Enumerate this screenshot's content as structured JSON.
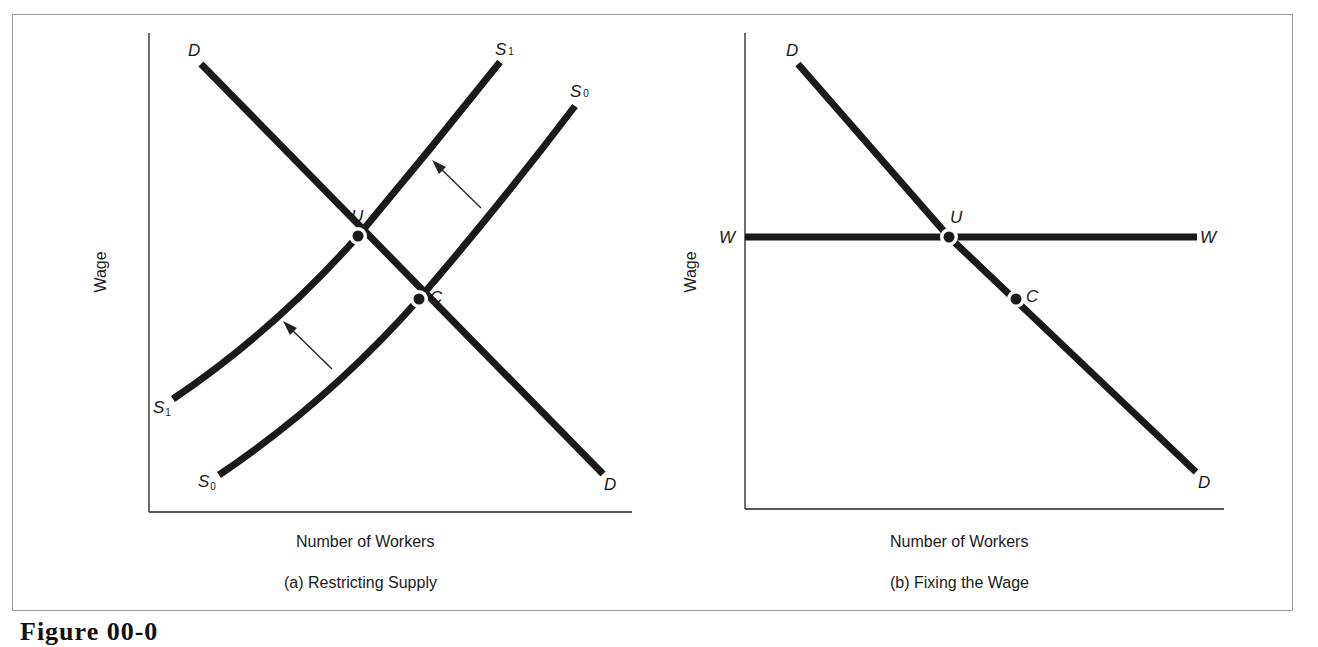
{
  "figure": {
    "number_label": "Figure 00-0"
  },
  "panels": [
    {
      "id": "a",
      "caption": "(a) Restricting Supply",
      "xlabel": "Number of Workers",
      "ylabel": "Wage",
      "curve_labels": {
        "demand_top": "D",
        "demand_bottom": "D",
        "s1_top": "S",
        "s1_top_sub": "1",
        "s1_bottom": "S",
        "s1_bottom_sub": "1",
        "s0_top": "S",
        "s0_top_sub": "0",
        "s0_bottom": "S",
        "s0_bottom_sub": "0"
      },
      "points": {
        "union": "U",
        "competitive": "C"
      }
    },
    {
      "id": "b",
      "caption": "(b) Fixing the Wage",
      "xlabel": "Number of Workers",
      "ylabel": "Wage",
      "curve_labels": {
        "demand_top": "D",
        "demand_bottom": "D",
        "wage_left": "W",
        "wage_right": "W"
      },
      "points": {
        "union": "U",
        "competitive": "C"
      }
    }
  ],
  "colors": {
    "line": "#1a1a1a",
    "frame": "#9a9a9a",
    "background": "#ffffff"
  }
}
